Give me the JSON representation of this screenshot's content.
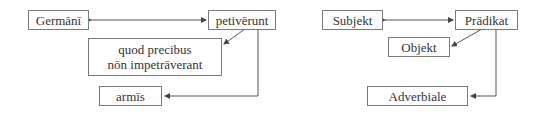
{
  "diagrams": [
    {
      "language": "latin",
      "nodes": {
        "subject": "Germānī",
        "predicate": "petivērunt",
        "clause_line1": "quod precibus",
        "clause_line2": "nōn impetrāverant",
        "adverbial": "armīs"
      }
    },
    {
      "language": "german",
      "nodes": {
        "subject": "Subjekt",
        "predicate": "Prädikat",
        "object": "Objekt",
        "adverbial": "Adverbiale"
      }
    }
  ],
  "colors": {
    "line": "#555555",
    "border": "#7a7a7a",
    "text": "#333333"
  }
}
